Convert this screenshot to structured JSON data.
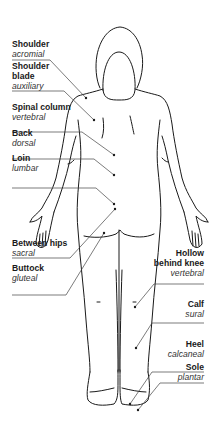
{
  "diagram": {
    "type": "anatomical-regions-posterior",
    "line_color": "#1a1a1a",
    "leader_color": "#444444",
    "labels_left": [
      {
        "term": "Shoulder",
        "latin": "acromial"
      },
      {
        "term": "Shoulder blade",
        "term_lines": [
          "Shoulder",
          "blade"
        ],
        "latin": "auxiliary"
      },
      {
        "term": "Spinal column",
        "latin": "vertebral"
      },
      {
        "term": "Back",
        "latin": "dorsal"
      },
      {
        "term": "Loin",
        "latin": "lumbar"
      },
      {
        "term": "Between hips",
        "latin": "sacral"
      },
      {
        "term": "Buttock",
        "latin": "gluteal"
      }
    ],
    "labels_right": [
      {
        "term": "Hollow behind knee",
        "term_lines": [
          "Hollow",
          "behind knee"
        ],
        "latin": "vertebral"
      },
      {
        "term": "Calf",
        "latin": "sural"
      },
      {
        "term": "Heel",
        "latin": "calcaneal"
      },
      {
        "term": "Sole",
        "latin": "plantar"
      }
    ]
  }
}
